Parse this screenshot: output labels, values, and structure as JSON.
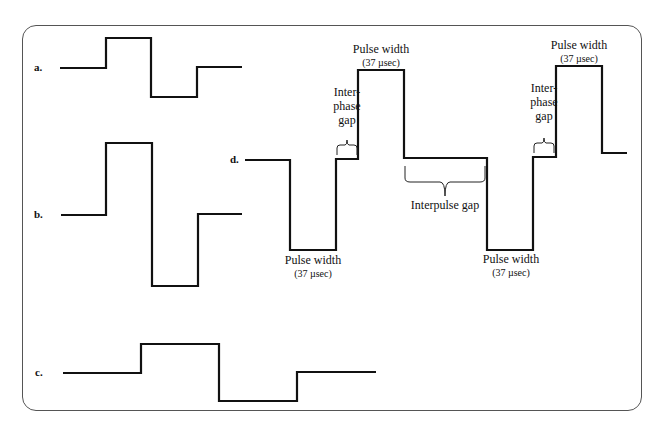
{
  "figure": {
    "panels": [
      {
        "id": "a",
        "label": "a."
      },
      {
        "id": "b",
        "label": "b."
      },
      {
        "id": "c",
        "label": "c."
      },
      {
        "id": "d",
        "label": "d."
      }
    ],
    "annotations": {
      "pulse_width_label": "Pulse width",
      "pulse_width_value": "(37 µsec)",
      "interphase_line1": "Inter-",
      "interphase_line2": "phase",
      "interphase_line3": "gap",
      "interpulse_gap": "Interpulse gap"
    },
    "colors": {
      "stroke": "#111111",
      "frame": "#555555",
      "background": "#ffffff"
    }
  }
}
